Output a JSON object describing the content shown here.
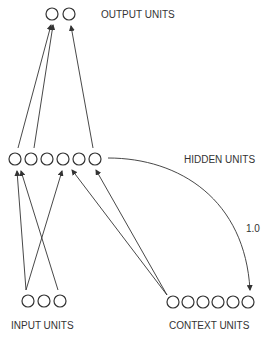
{
  "labels": {
    "output": "OUTPUT UNITS",
    "hidden": "HIDDEN UNITS",
    "input": "INPUT UNITS",
    "context": "CONTEXT UNITS",
    "recurrent_weight": "1.0"
  },
  "layers": {
    "output": {
      "count": 2
    },
    "hidden": {
      "count": 6
    },
    "input": {
      "count": 3
    },
    "context": {
      "count": 6
    }
  },
  "colors": {
    "stroke": "#333333",
    "background": "#ffffff"
  }
}
